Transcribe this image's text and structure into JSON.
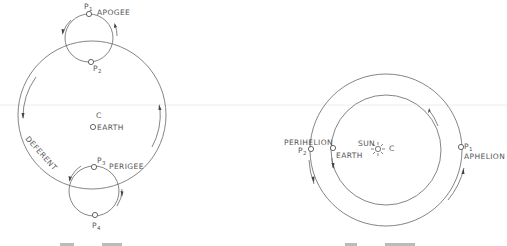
{
  "colors": {
    "background": "#ffffff",
    "line": "#666666",
    "text": "#555555",
    "scan_line": "#e8e8e8"
  },
  "left_diagram": {
    "name": "ptolemaic-epicycle-model",
    "deferent_label": "DEFERENT",
    "center_label": "C",
    "earth_label": "EARTH",
    "points": [
      {
        "id": "P",
        "sub": "1",
        "label": "APOGEE"
      },
      {
        "id": "P",
        "sub": "2",
        "label": ""
      },
      {
        "id": "P",
        "sub": "3",
        "label": "PERIGEE"
      },
      {
        "id": "P",
        "sub": "4",
        "label": ""
      }
    ]
  },
  "right_diagram": {
    "name": "heliocentric-orbit-model",
    "sun_label": "SUN",
    "center_label": "C",
    "earth_label": "EARTH",
    "points": [
      {
        "id": "P",
        "sub": "1",
        "label": "APHELION"
      },
      {
        "id": "P",
        "sub": "2",
        "label": "PERIHELION"
      }
    ]
  }
}
